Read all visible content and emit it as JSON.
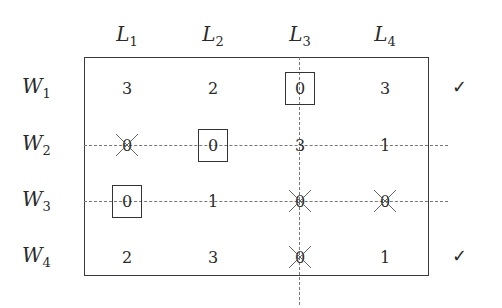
{
  "columns": [
    {
      "base": "L",
      "sub": "1",
      "x": 127
    },
    {
      "base": "L",
      "sub": "2",
      "x": 213
    },
    {
      "base": "L",
      "sub": "3",
      "x": 300
    },
    {
      "base": "L",
      "sub": "4",
      "x": 385
    }
  ],
  "rows": [
    {
      "base": "W",
      "sub": "1",
      "y": 88,
      "checked": true
    },
    {
      "base": "W",
      "sub": "2",
      "y": 145,
      "checked": false
    },
    {
      "base": "W",
      "sub": "3",
      "y": 201,
      "checked": false
    },
    {
      "base": "W",
      "sub": "4",
      "y": 257,
      "checked": true
    }
  ],
  "matrix": [
    [
      {
        "v": "3"
      },
      {
        "v": "2"
      },
      {
        "v": "0",
        "boxed": true
      },
      {
        "v": "3"
      }
    ],
    [
      {
        "v": "0",
        "crossed": true
      },
      {
        "v": "0",
        "boxed": true
      },
      {
        "v": "3"
      },
      {
        "v": "1"
      }
    ],
    [
      {
        "v": "0",
        "boxed": true
      },
      {
        "v": "1"
      },
      {
        "v": "0",
        "crossed": true
      },
      {
        "v": "0",
        "crossed": true
      }
    ],
    [
      {
        "v": "2"
      },
      {
        "v": "3"
      },
      {
        "v": "0",
        "crossed": true
      },
      {
        "v": "1"
      }
    ]
  ],
  "check_mark": "✓",
  "covered_lines": {
    "columns": [
      "L3"
    ],
    "rows": [
      "W2",
      "W3"
    ]
  }
}
